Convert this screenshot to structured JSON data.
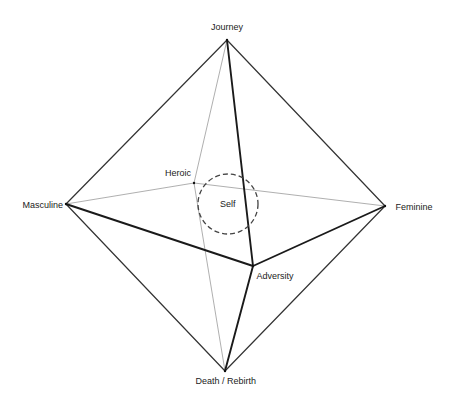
{
  "diagram": {
    "type": "octahedron",
    "vertices": [
      {
        "id": "journey",
        "label": "Journey",
        "x": 227,
        "y": 40,
        "label_x": 227,
        "label_y": 27,
        "align": "center"
      },
      {
        "id": "heroic",
        "label": "Heroic",
        "x": 194,
        "y": 183,
        "label_x": 178,
        "label_y": 173,
        "align": "center"
      },
      {
        "id": "masculine",
        "label": "Masculine",
        "x": 66,
        "y": 204,
        "label_x": 43,
        "label_y": 205,
        "align": "center"
      },
      {
        "id": "feminine",
        "label": "Feminine",
        "x": 385,
        "y": 206,
        "label_x": 414,
        "label_y": 207,
        "align": "center"
      },
      {
        "id": "adversity",
        "label": "Adversity",
        "x": 253,
        "y": 266,
        "label_x": 275,
        "label_y": 276,
        "align": "center"
      },
      {
        "id": "death_rebirth",
        "label": "Death / Rebirth",
        "x": 225,
        "y": 371,
        "label_x": 226,
        "label_y": 381,
        "align": "center"
      }
    ],
    "center": {
      "label": "Self",
      "x": 228,
      "y": 204,
      "r": 30
    },
    "edges": [
      {
        "from": "journey",
        "to": "masculine",
        "style": "outer"
      },
      {
        "from": "journey",
        "to": "feminine",
        "style": "outer"
      },
      {
        "from": "death_rebirth",
        "to": "masculine",
        "style": "outer"
      },
      {
        "from": "death_rebirth",
        "to": "feminine",
        "style": "outer"
      },
      {
        "from": "journey",
        "to": "adversity",
        "style": "front"
      },
      {
        "from": "masculine",
        "to": "adversity",
        "style": "front"
      },
      {
        "from": "adversity",
        "to": "feminine",
        "style": "front"
      },
      {
        "from": "adversity",
        "to": "death_rebirth",
        "style": "front"
      },
      {
        "from": "journey",
        "to": "heroic",
        "style": "back"
      },
      {
        "from": "heroic",
        "to": "masculine",
        "style": "back"
      },
      {
        "from": "heroic",
        "to": "feminine",
        "style": "back"
      },
      {
        "from": "heroic",
        "to": "death_rebirth",
        "style": "back"
      }
    ],
    "colors": {
      "outer": "#333333",
      "front": "#1a1a1a",
      "back": "#9a9a9a",
      "circle": "#444444",
      "text": "#222222"
    }
  }
}
